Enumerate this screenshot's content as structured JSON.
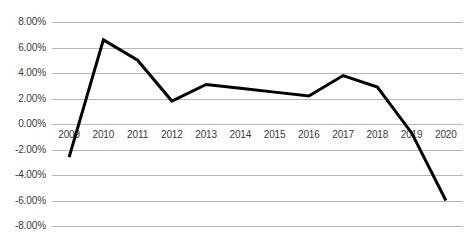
{
  "chart_data": {
    "type": "line",
    "title": "",
    "subtitle": "",
    "xlabel": "",
    "ylabel": "",
    "categories": [
      "2009",
      "2010",
      "2011",
      "2012",
      "2013",
      "2014",
      "2015",
      "2016",
      "2017",
      "2018",
      "2019",
      "2020"
    ],
    "series": [
      {
        "name": "",
        "values": [
          -2.6,
          6.6,
          5.0,
          1.8,
          3.1,
          2.8,
          2.5,
          2.2,
          3.8,
          2.9,
          -0.7,
          -6.0
        ]
      }
    ],
    "values": [
      -2.6,
      6.6,
      5.0,
      1.8,
      3.1,
      2.8,
      2.5,
      2.2,
      3.8,
      2.9,
      -0.7,
      -6.0
    ],
    "ylim": [
      -8,
      8
    ],
    "ytick_labels": [
      "8.00%",
      "6.00%",
      "4.00%",
      "2.00%",
      "0.00%",
      "-2.00%",
      "-4.00%",
      "-6.00%",
      "-8.00%"
    ],
    "ytick_values": [
      8,
      6,
      4,
      2,
      0,
      -2,
      -4,
      -6,
      -8
    ],
    "xtick_labels": [
      "2009",
      "2010",
      "2011",
      "2012",
      "2013",
      "2014",
      "2015",
      "2016",
      "2017",
      "2018",
      "2019",
      "2020"
    ],
    "grid": true,
    "grid_axis": "y",
    "legend": false,
    "legend_position": "none",
    "line_color": "#000000",
    "line_width": 3,
    "gridline_color": "#b7b7b7",
    "background_color": "#ffffff",
    "markers": false
  }
}
